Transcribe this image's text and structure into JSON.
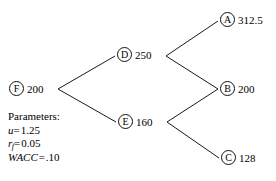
{
  "figure": {
    "type": "binomial-lattice-diagram",
    "nodes": [
      {
        "id": "F",
        "letter": "F",
        "value": "200",
        "label_side": "right"
      },
      {
        "id": "D",
        "letter": "D",
        "value": "250",
        "label_side": "right"
      },
      {
        "id": "E",
        "letter": "E",
        "value": "160",
        "label_side": "right"
      },
      {
        "id": "A",
        "letter": "A",
        "value": "312.5",
        "label_side": "right"
      },
      {
        "id": "B",
        "letter": "B",
        "value": "200",
        "label_side": "right"
      },
      {
        "id": "C",
        "letter": "C",
        "value": "128",
        "label_side": "right"
      }
    ],
    "edges": [
      {
        "from": "F",
        "to": "D"
      },
      {
        "from": "F",
        "to": "E"
      },
      {
        "from": "D",
        "to": "A"
      },
      {
        "from": "D",
        "to": "B"
      },
      {
        "from": "E",
        "to": "B"
      },
      {
        "from": "E",
        "to": "C"
      }
    ],
    "stroke_color": "#1a1a1a",
    "text_color": "#000000",
    "background_color": "#ffffff"
  },
  "parameters": {
    "heading": "Parameters:",
    "items": [
      {
        "symbol": "u",
        "subscript": "",
        "operator": "=",
        "value": "1.25"
      },
      {
        "symbol": "r",
        "subscript": "f",
        "operator": "=",
        "value": "0.05"
      },
      {
        "symbol": "WACC",
        "subscript": "",
        "operator": "=",
        "value": ".10"
      }
    ],
    "line_u": "u = 1.25",
    "line_rf": "rf = 0.05",
    "line_wacc": "WACC = .10"
  }
}
